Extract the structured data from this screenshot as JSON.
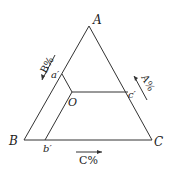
{
  "diagram": {
    "type": "ternary-composition-diagram",
    "vertices": {
      "A": {
        "label": "A",
        "x": 89,
        "y": 26
      },
      "B": {
        "label": "B",
        "x": 24,
        "y": 140
      },
      "C": {
        "label": "C",
        "x": 152,
        "y": 140
      }
    },
    "point": {
      "label": "O",
      "x": 72,
      "y": 92
    },
    "projections": {
      "a_prime": {
        "label": "a′",
        "x": 62,
        "y": 74
      },
      "b_prime": {
        "label": "b′",
        "x": 45,
        "y": 140
      },
      "c_prime": {
        "label": "c′",
        "x": 128,
        "y": 92
      }
    },
    "axis_labels": {
      "left": "B%",
      "right": "A%",
      "bottom": "C%"
    },
    "colors": {
      "line": "#333333",
      "text": "#222222"
    }
  }
}
